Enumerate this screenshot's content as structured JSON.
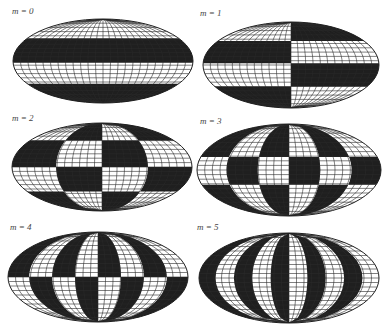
{
  "figure": {
    "colors": {
      "dark": "#1f1f1f",
      "light": "#ffffff",
      "grid": "#2a2a2a",
      "label": "#444444"
    },
    "panels": [
      {
        "label": "m = 0",
        "m": 0,
        "cx": 103,
        "cy": 61,
        "rx": 90,
        "ry": 42,
        "label_x": 12,
        "label_y": 6,
        "lat_bounds": [
          0.23,
          0.52,
          0.77
        ],
        "lon_sectors": 1,
        "top_left_dark": false
      },
      {
        "label": "m = 1",
        "m": 1,
        "cx": 291,
        "cy": 65,
        "rx": 88,
        "ry": 43,
        "label_x": 200,
        "label_y": 8,
        "lat_bounds": [
          0.22,
          0.48,
          0.75
        ],
        "lon_sectors": 2,
        "top_left_dark": false
      },
      {
        "label": "m = 2",
        "m": 2,
        "cx": 102,
        "cy": 167,
        "rx": 90,
        "ry": 44,
        "label_x": 12,
        "label_y": 113,
        "lat_bounds": [
          0.2,
          0.5,
          0.78
        ],
        "lon_sectors": 4,
        "top_left_dark": false
      },
      {
        "label": "m = 3",
        "m": 3,
        "cx": 289,
        "cy": 170,
        "rx": 92,
        "ry": 46,
        "label_x": 200,
        "label_y": 116,
        "lat_bounds": [
          0.36,
          0.66
        ],
        "lon_sectors": 6,
        "top_left_dark": true
      },
      {
        "label": "m = 4",
        "m": 4,
        "cx": 98,
        "cy": 277,
        "rx": 90,
        "ry": 45,
        "label_x": 10,
        "label_y": 222,
        "lat_bounds": [
          0.5
        ],
        "lon_sectors": 8,
        "top_left_dark": true
      },
      {
        "label": "m = 5",
        "m": 5,
        "cx": 289,
        "cy": 278,
        "rx": 90,
        "ry": 45,
        "label_x": 197,
        "label_y": 222,
        "lat_bounds": [],
        "lon_sectors": 10,
        "top_left_dark": true
      }
    ],
    "grid": {
      "meridians": 24,
      "parallels": 10
    }
  }
}
